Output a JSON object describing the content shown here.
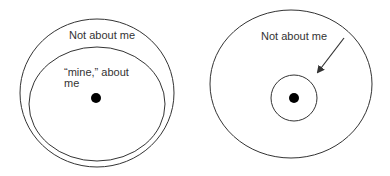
{
  "diagrams": [
    {
      "id": "left",
      "outer_label": "Not about me",
      "inner_label_line1": "“mine,” about",
      "inner_label_line2": "me"
    },
    {
      "id": "right",
      "outer_label": "Not about me"
    }
  ],
  "colors": {
    "stroke": "#333333",
    "dot": "#000000",
    "background": "#ffffff"
  }
}
